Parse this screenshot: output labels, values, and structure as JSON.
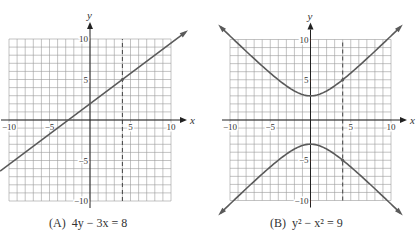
{
  "colors": {
    "grid": "#9a9a9a",
    "axis": "#222222",
    "curve": "#5a5a5a",
    "dashed": "#444444",
    "text": "#333333"
  },
  "chart_data": [
    {
      "type": "line",
      "panel": "A",
      "caption": "(A)  4y − 3x = 8",
      "caption_label": "(A)",
      "equation": "4y − 3x = 8",
      "xlabel": "x",
      "ylabel": "y",
      "xlim": [
        -10,
        10
      ],
      "ylim": [
        -10,
        10
      ],
      "grid": true,
      "grid_step": 1,
      "x_ticks": [
        -10,
        -5,
        5,
        10
      ],
      "x_tick_labels": [
        "−10",
        "−5",
        "5",
        "10"
      ],
      "y_ticks": [
        10,
        5,
        -5,
        -10
      ],
      "y_tick_labels": [
        "10",
        "5",
        "−5",
        "−10"
      ],
      "dashed_vertical_line_x": 4,
      "marked_point": {
        "x": 4,
        "y": 5
      },
      "series": [
        {
          "name": "y = (3x + 8)/4",
          "x": [
            -11.1,
            -10,
            -5,
            0,
            4,
            5,
            10,
            11.8
          ],
          "y": [
            -6.33,
            -5.5,
            -1.75,
            2,
            5,
            5.75,
            9.5,
            10.85
          ]
        }
      ]
    },
    {
      "type": "line",
      "panel": "B",
      "caption": "(B)  y² − x² = 9",
      "caption_label": "(B)",
      "equation": "y² − x² = 9",
      "xlabel": "x",
      "ylabel": "y",
      "xlim": [
        -10,
        10
      ],
      "ylim": [
        -10,
        10
      ],
      "grid": true,
      "grid_step": 1,
      "x_ticks": [
        -10,
        -5,
        5,
        10
      ],
      "x_tick_labels": [
        "−10",
        "−5",
        "5",
        "10"
      ],
      "y_ticks": [
        10,
        5,
        -5,
        -10
      ],
      "y_tick_labels": [
        "10",
        "5",
        "−5",
        "−10"
      ],
      "dashed_vertical_line_x": 4,
      "marked_points": [
        {
          "x": 4,
          "y": 5
        },
        {
          "x": 4,
          "y": -5
        }
      ],
      "series": [
        {
          "name": "upper branch y = √(x²+9)",
          "x": [
            -11,
            -10,
            -5,
            -4,
            0,
            4,
            5,
            10,
            11
          ],
          "y": [
            11.4,
            10.44,
            5.83,
            5,
            3,
            5,
            5.83,
            10.44,
            11.4
          ]
        },
        {
          "name": "lower branch y = −√(x²+9)",
          "x": [
            -11,
            -10,
            -5,
            -4,
            0,
            4,
            5,
            10,
            11
          ],
          "y": [
            -11.4,
            -10.44,
            -5.83,
            -5,
            -3,
            -5,
            -5.83,
            -10.44,
            -11.4
          ]
        }
      ]
    }
  ]
}
